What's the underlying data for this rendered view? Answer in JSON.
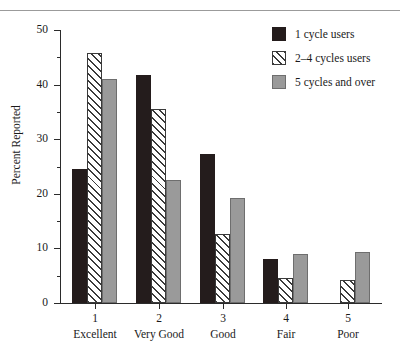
{
  "page": {
    "clipped_header_text": "",
    "y_axis_title": "Percent Reported"
  },
  "legend": {
    "items": [
      {
        "label": "1 cycle users",
        "swatch": "solid-dark-swatch",
        "color": "#241c1c"
      },
      {
        "label": "2–4 cycles users",
        "swatch": "hatched-swatch",
        "color": "#ffffff"
      },
      {
        "label": "5 cycles and over",
        "swatch": "solid-gray-swatch",
        "color": "#9a9a9a"
      }
    ]
  },
  "y_axis": {
    "major_ticks": [
      "50",
      "40",
      "30",
      "20",
      "10",
      "0"
    ],
    "minor_ticks": [
      45,
      35,
      25,
      15,
      5
    ]
  },
  "x_axis": {
    "labels": [
      {
        "num": "1",
        "name": "Excellent"
      },
      {
        "num": "2",
        "name": "Very Good"
      },
      {
        "num": "3",
        "name": "Good"
      },
      {
        "num": "4",
        "name": "Fair"
      },
      {
        "num": "5",
        "name": "Poor"
      }
    ]
  },
  "chart_data": {
    "type": "bar",
    "title": "",
    "xlabel": "",
    "ylabel": "Percent Reported",
    "ylim": [
      0,
      50
    ],
    "ytick_interval": 10,
    "yminor_interval": 5,
    "grid": false,
    "legend_position": "top-right",
    "categories": [
      "1 Excellent",
      "2 Very Good",
      "3 Good",
      "4 Fair",
      "5 Poor"
    ],
    "category_numbers": [
      "1",
      "2",
      "3",
      "4",
      "5"
    ],
    "category_names": [
      "Excellent",
      "Very Good",
      "Good",
      "Fair",
      "Poor"
    ],
    "series": [
      {
        "name": "1 cycle users",
        "color": "#241c1c",
        "pattern": "solid",
        "values": [
          24.5,
          41.8,
          27.2,
          8.0,
          0
        ]
      },
      {
        "name": "2–4 cycles users",
        "color": "#ffffff",
        "pattern": "hatch",
        "values": [
          45.8,
          35.5,
          12.6,
          4.6,
          4.2
        ]
      },
      {
        "name": "5 cycles and over",
        "color": "#9a9a9a",
        "pattern": "solid",
        "values": [
          41.0,
          22.6,
          19.3,
          8.9,
          9.4
        ]
      }
    ]
  }
}
